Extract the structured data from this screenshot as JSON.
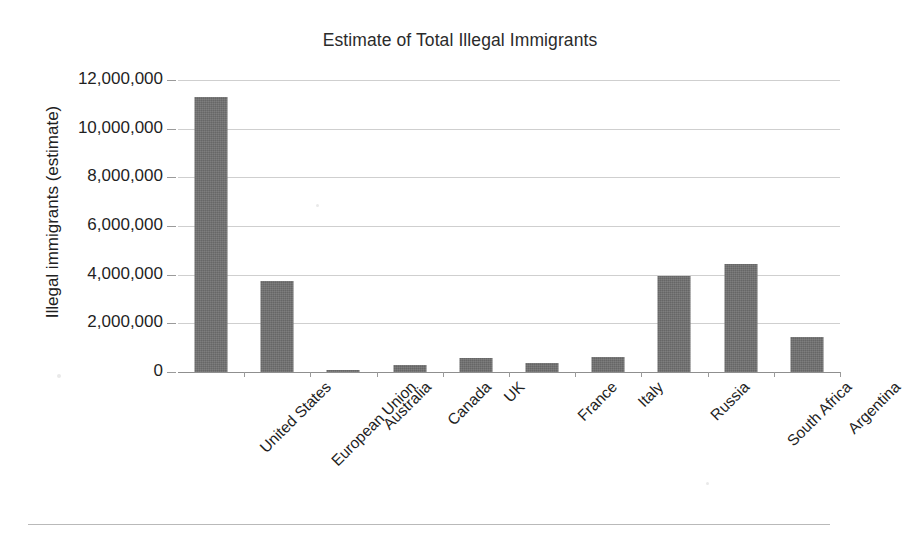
{
  "chart_data": {
    "type": "bar",
    "title": "Estimate of Total Illegal Immigrants",
    "xlabel": "",
    "ylabel": "Illegal immigrants (estimate)",
    "ylim": [
      0,
      12000000
    ],
    "ytick_step": 2000000,
    "grid": true,
    "legend": "none",
    "bar_color": "#6f6f6f",
    "categories": [
      "United States",
      "European Union",
      "Australia",
      "Canada",
      "UK",
      "France",
      "Italy",
      "Russia",
      "South Africa",
      "Argentina"
    ],
    "values": [
      11300000,
      3750000,
      80000,
      290000,
      570000,
      350000,
      600000,
      3950000,
      4450000,
      1450000
    ],
    "ytick_labels": [
      "12,000,000",
      "10,000,000",
      "8,000,000",
      "6,000,000",
      "4,000,000",
      "2,000,000",
      "0"
    ],
    "ytick_values": [
      12000000,
      10000000,
      8000000,
      6000000,
      4000000,
      2000000,
      0
    ]
  }
}
